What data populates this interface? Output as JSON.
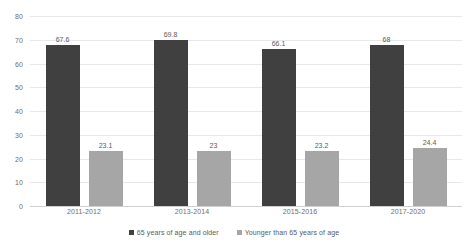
{
  "chart_data": {
    "type": "bar",
    "title": "",
    "subtitle": "",
    "xlabel": "",
    "ylabel": "",
    "ylim": [
      0,
      80
    ],
    "ytick_step": 10,
    "yticks": [
      0,
      10,
      20,
      30,
      40,
      50,
      60,
      70,
      80
    ],
    "grid": true,
    "legend_position": "bottom",
    "categories": [
      "2011-2012",
      "2013-2014",
      "2015-2016",
      "2017-2020"
    ],
    "series": [
      {
        "name": "65 years of age and older",
        "color": "#404040",
        "values": [
          67.6,
          69.8,
          66.1,
          68
        ],
        "labels": [
          "67.6",
          "69.8",
          "66.1",
          "68"
        ]
      },
      {
        "name": "Younger than 65 years of age",
        "color": "#a6a6a6",
        "values": [
          23.1,
          23,
          23.2,
          24.4
        ],
        "labels": [
          "23.1",
          "23",
          "23.2",
          "24.4"
        ]
      }
    ]
  },
  "colors": {
    "series_older": "#404040",
    "series_younger": "#a6a6a6",
    "gridline": "#e8e8e8",
    "axis": "#d0d0d0",
    "text": "#595959",
    "background": "#ffffff"
  }
}
